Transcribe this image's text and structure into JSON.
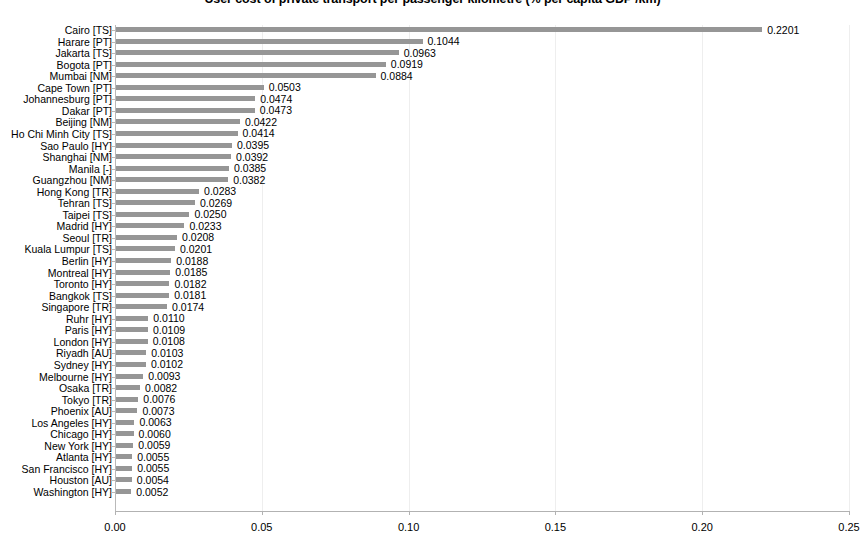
{
  "chart_data": {
    "type": "bar",
    "orientation": "horizontal",
    "title": "User cost of private transport per passenger kilometre (% per capita GDP /km)",
    "xlabel": "",
    "ylabel": "",
    "xlim": [
      0,
      0.25
    ],
    "x_ticks": [
      "0.00",
      "0.05",
      "0.10",
      "0.15",
      "0.20",
      "0.25"
    ],
    "x_tick_values": [
      0,
      0.05,
      0.1,
      0.15,
      0.2,
      0.25
    ],
    "grid": true,
    "legend": "none",
    "bar_color": "#969696",
    "data_labels": true,
    "categories": [
      "Cairo [TS]",
      "Harare [PT]",
      "Jakarta [TS]",
      "Bogota [PT]",
      "Mumbai [NM]",
      "Cape Town [PT]",
      "Johannesburg [PT]",
      "Dakar [PT]",
      "Beijing [NM]",
      "Ho Chi Minh City [TS]",
      "Sao Paulo [HY]",
      "Shanghai [NM]",
      "Manila [-]",
      "Guangzhou [NM]",
      "Hong Kong [TR]",
      "Tehran [TS]",
      "Taipei [TS]",
      "Madrid [HY]",
      "Seoul [TR]",
      "Kuala Lumpur [TS]",
      "Berlin [HY]",
      "Montreal [HY]",
      "Toronto [HY]",
      "Bangkok [TS]",
      "Singapore [TR]",
      "Ruhr [HY]",
      "Paris [HY]",
      "London [HY]",
      "Riyadh [AU]",
      "Sydney [HY]",
      "Melbourne [HY]",
      "Osaka [TR]",
      "Tokyo [TR]",
      "Phoenix [AU]",
      "Los Angeles [HY]",
      "Chicago [HY]",
      "New York [HY]",
      "Atlanta [HY]",
      "San Francisco [HY]",
      "Houston [AU]",
      "Washington [HY]"
    ],
    "values": [
      0.2201,
      0.1044,
      0.0963,
      0.0919,
      0.0884,
      0.0503,
      0.0474,
      0.0473,
      0.0422,
      0.0414,
      0.0395,
      0.0392,
      0.0385,
      0.0382,
      0.0283,
      0.0269,
      0.025,
      0.0233,
      0.0208,
      0.0201,
      0.0188,
      0.0185,
      0.0182,
      0.0181,
      0.0174,
      0.011,
      0.0109,
      0.0108,
      0.0103,
      0.0102,
      0.0093,
      0.0082,
      0.0076,
      0.0073,
      0.0063,
      0.006,
      0.0059,
      0.0055,
      0.0055,
      0.0054,
      0.0052
    ],
    "value_labels": [
      "0.2201",
      "0.1044",
      "0.0963",
      "0.0919",
      "0.0884",
      "0.0503",
      "0.0474",
      "0.0473",
      "0.0422",
      "0.0414",
      "0.0395",
      "0.0392",
      "0.0385",
      "0.0382",
      "0.0283",
      "0.0269",
      "0.0250",
      "0.0233",
      "0.0208",
      "0.0201",
      "0.0188",
      "0.0185",
      "0.0182",
      "0.0181",
      "0.0174",
      "0.0110",
      "0.0109",
      "0.0108",
      "0.0103",
      "0.0102",
      "0.0093",
      "0.0082",
      "0.0076",
      "0.0073",
      "0.0063",
      "0.0060",
      "0.0059",
      "0.0055",
      "0.0055",
      "0.0054",
      "0.0052"
    ]
  }
}
